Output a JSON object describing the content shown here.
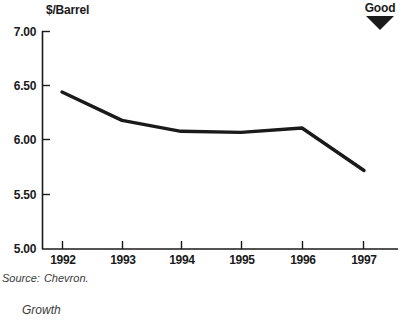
{
  "chart_data": {
    "type": "line",
    "title": "",
    "subtitle": "",
    "xlabel": "",
    "ylabel": "$/Barrel",
    "categories": [
      "1992",
      "1993",
      "1994",
      "1995",
      "1996",
      "1997"
    ],
    "values": [
      6.44,
      6.18,
      6.08,
      6.07,
      6.11,
      5.72
    ],
    "series": [
      {
        "name": "Operating expense per barrel",
        "values": [
          6.44,
          6.18,
          6.08,
          6.07,
          6.11,
          5.72
        ]
      }
    ],
    "ylim": [
      5.0,
      7.0
    ],
    "ytick_labels": [
      "7.00",
      "6.50",
      "6.00",
      "5.50",
      "5.00"
    ],
    "ytick_values": [
      7.0,
      6.5,
      6.0,
      5.5,
      5.0
    ],
    "xtick_labels": [
      "1992",
      "1993",
      "1994",
      "1995",
      "1996",
      "1997"
    ],
    "grid": false,
    "legend": false,
    "legend_position": "none",
    "line_color": "#1a1a1a",
    "axis_color": "#1a1a1a",
    "annotations": [
      {
        "name": "direction-indicator",
        "text": "Good",
        "glyph": "down-triangle",
        "position": "top-right"
      }
    ]
  },
  "axis": {
    "y_title": "$/Barrel"
  },
  "indicator": {
    "label": "Good",
    "icon": "down-triangle-icon"
  },
  "footer": {
    "source_label": "Source:",
    "source_value": "Chevron.",
    "caption": "Growth"
  }
}
